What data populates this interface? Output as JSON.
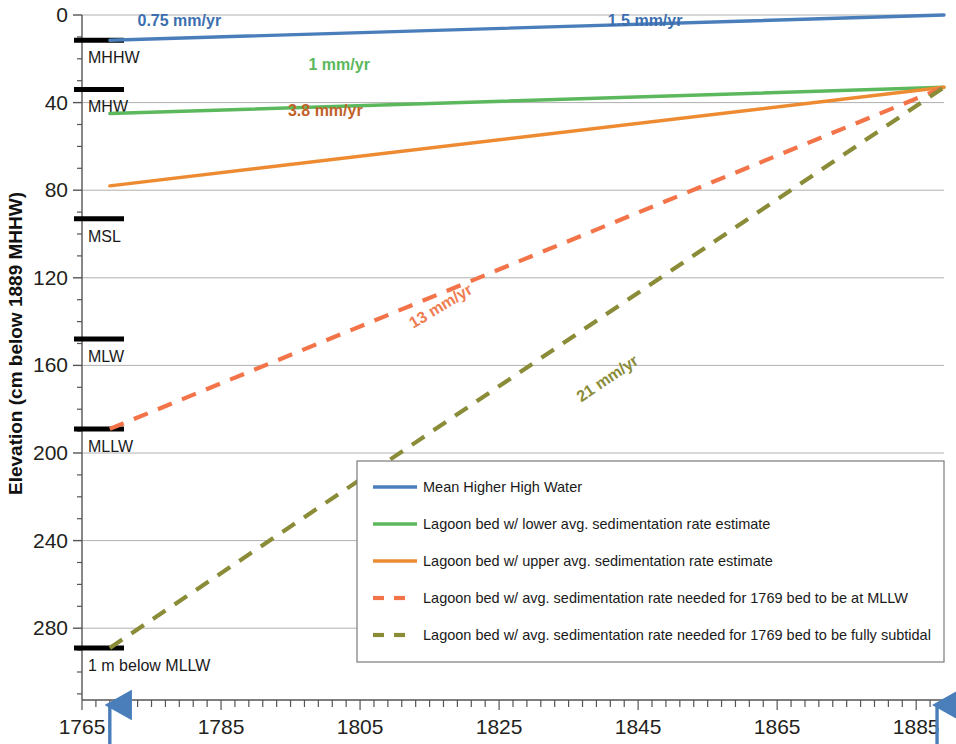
{
  "chart_data": {
    "type": "line",
    "title": "",
    "xlabel": "Year",
    "ylabel": "Elevation (cm below 1889 MHHW)",
    "xlim": [
      1765,
      1889
    ],
    "ylim": [
      0,
      300
    ],
    "y_inverted": true,
    "grid": true,
    "legend_position": "bottom-right inside plot",
    "x_ticks": [
      "1765",
      "1785",
      "1805",
      "1825",
      "1845",
      "1865",
      "1885"
    ],
    "x_tick_values": [
      1765,
      1785,
      1805,
      1825,
      1845,
      1865,
      1885
    ],
    "x_minor_tick_interval": 2,
    "y_ticks": [
      "0",
      "40",
      "80",
      "120",
      "160",
      "200",
      "240",
      "280"
    ],
    "y_tick_values": [
      0,
      40,
      80,
      120,
      160,
      200,
      240,
      280
    ],
    "y_minor_tick_interval": 10,
    "series": [
      {
        "name": "Mean Higher High Water",
        "color": "#4a7ebb",
        "style": "solid",
        "x": [
          1769,
          1889
        ],
        "y": [
          11.5,
          0
        ],
        "annotations": [
          "0.75 mm/yr",
          "1.5 mm/yr"
        ]
      },
      {
        "name": "Lagoon bed w/ lower avg. sedimentation rate estimate",
        "color": "#5cb85c",
        "style": "solid",
        "x": [
          1769,
          1889
        ],
        "y": [
          45,
          33
        ],
        "annotations": [
          "1 mm/yr"
        ]
      },
      {
        "name": "Lagoon bed w/ upper avg. sedimentation rate estimate",
        "color": "#ed8b33",
        "style": "solid",
        "x": [
          1769,
          1889
        ],
        "y": [
          78,
          33
        ],
        "annotations": [
          "3.8 mm/yr"
        ]
      },
      {
        "name": "Lagoon bed w/ avg. sedimentation rate needed for 1769 bed to be at MLLW",
        "color": "#f4744a",
        "style": "dashed",
        "x": [
          1769,
          1889
        ],
        "y": [
          189,
          33
        ],
        "annotations": [
          "13 mm/yr"
        ]
      },
      {
        "name": "Lagoon bed w/ avg. sedimentation rate needed for 1769 bed to be fully subtidal",
        "color": "#8a8c38",
        "style": "dashed",
        "x": [
          1769,
          1889
        ],
        "y": [
          289,
          33
        ],
        "annotations": [
          "21 mm/yr"
        ]
      }
    ],
    "rate_annotations": [
      {
        "text": "0.75 mm/yr",
        "color": "#3d6fb0",
        "x": 1779,
        "y": 5,
        "rotation": 0
      },
      {
        "text": "1.5 mm/yr",
        "color": "#3d6fb0",
        "x": 1846,
        "y": 5,
        "rotation": 0
      },
      {
        "text": "1 mm/yr",
        "color": "#5cb85c",
        "x": 1802,
        "y": 25,
        "rotation": 0
      },
      {
        "text": "3.8 mm/yr",
        "color": "#c1622a",
        "x": 1800,
        "y": 46,
        "rotation": 0
      },
      {
        "text": "13 mm/yr",
        "color": "#ef7d52",
        "x": 1817,
        "y": 135,
        "rotation": -31
      },
      {
        "text": "21 mm/yr",
        "color": "#8a8c38",
        "x": 1841,
        "y": 168,
        "rotation": -34
      }
    ],
    "tide_datums": [
      {
        "label": "MHHW",
        "value": 11.5
      },
      {
        "label": "MHW",
        "value": 34
      },
      {
        "label": "MSL",
        "value": 93
      },
      {
        "label": "MLW",
        "value": 148
      },
      {
        "label": "MLLW",
        "value": 189
      },
      {
        "label": "1 m below MLLW",
        "value": 289
      }
    ],
    "event_markers": [
      {
        "year_label": "1769",
        "text": ": Crespi observations",
        "x": 1769,
        "color": "#4a7ebb"
      },
      {
        "year_label": "1887-1889",
        "text": ": T-sheet mapping",
        "x": 1888,
        "color": "#4a7ebb"
      }
    ]
  },
  "legend": {
    "items": [
      {
        "label": "Mean Higher High Water",
        "color": "#4a7ebb",
        "style": "solid"
      },
      {
        "label": "Lagoon bed w/ lower avg. sedimentation rate estimate",
        "color": "#5cb85c",
        "style": "solid"
      },
      {
        "label": "Lagoon bed w/ upper avg. sedimentation rate estimate",
        "color": "#ed8b33",
        "style": "solid"
      },
      {
        "label": "Lagoon bed w/ avg. sedimentation rate needed for 1769 bed to be at MLLW",
        "color": "#f4744a",
        "style": "dashed"
      },
      {
        "label": "Lagoon bed w/ avg. sedimentation rate needed for 1769 bed to be fully subtidal",
        "color": "#8a8c38",
        "style": "dashed"
      }
    ]
  },
  "colors": {
    "grid": "#b0b0b0",
    "axis": "#555555",
    "text": "#231f20",
    "datum_bar": "#000000",
    "arrow": "#4a7ebb"
  }
}
